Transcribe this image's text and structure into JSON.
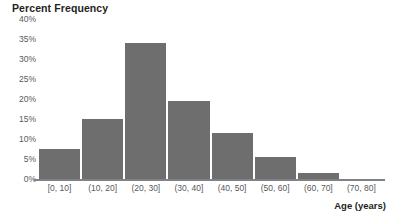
{
  "chart_data": {
    "type": "bar",
    "title": "Percent Frequency",
    "subtitle": "",
    "xlabel": "Age (years)",
    "ylabel": "Percent Frequency",
    "categories": [
      "[0, 10]",
      "(10, 20]",
      "(20, 30]",
      "(30, 40]",
      "(40, 50]",
      "(50, 60]",
      "(60, 70]",
      "(70, 80]"
    ],
    "values": [
      7.5,
      15,
      34,
      19.5,
      11.5,
      5.5,
      1.5,
      0
    ],
    "value_labels": [
      "7.5%",
      "15%",
      "34%",
      "19.5%",
      "11.5%",
      "5.5%",
      "1.5%",
      "0%"
    ],
    "ylim": [
      0,
      40
    ],
    "ytick_values": [
      0,
      5,
      10,
      15,
      20,
      25,
      30,
      35,
      40
    ],
    "ytick_labels": [
      "0%",
      "5%",
      "10%",
      "15%",
      "20%",
      "25%",
      "30%",
      "35%",
      "40%"
    ],
    "grid": false,
    "legend": null,
    "bar_color": "#6e6e6e",
    "axis_color": "#808285",
    "tick_label_color": "#58595b",
    "title_color": "#231f20",
    "background": "#ffffff"
  }
}
